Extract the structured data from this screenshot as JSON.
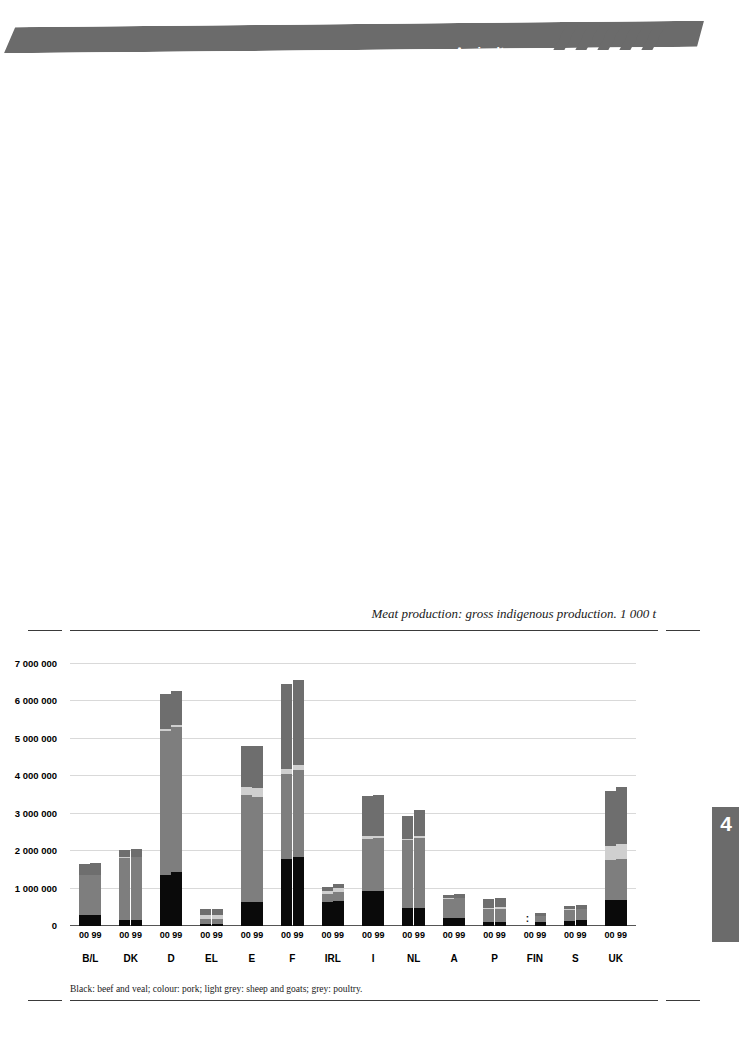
{
  "header": {
    "section_title": "Agriculture",
    "banner_color": "#6b6b6b",
    "stripe_count": 5
  },
  "page_tab": {
    "number": "4",
    "color": "#6b6b6b"
  },
  "footnote": "Black: beef and veal; colour: pork; light grey: sheep and goats; grey: poultry.",
  "chart_data": {
    "type": "bar",
    "subtype": "stacked-grouped",
    "title": "Meat production: gross indigenous production. 1 000 t",
    "xlabel": "",
    "ylabel": "",
    "ylim": [
      0,
      7000000
    ],
    "grid": true,
    "legend_position": "footnote",
    "yticks": [
      0,
      1000000,
      2000000,
      3000000,
      4000000,
      5000000,
      6000000,
      7000000
    ],
    "ytick_labels": [
      "0",
      "1 000 000",
      "2 000 000",
      "3 000 000",
      "4 000 000",
      "5 000 000",
      "6 000 000",
      "7 000 000"
    ],
    "categories": [
      "B/L",
      "DK",
      "D",
      "EL",
      "E",
      "F",
      "IRL",
      "I",
      "NL",
      "A",
      "P",
      "FIN",
      "S",
      "UK"
    ],
    "year_labels": [
      "00",
      "99"
    ],
    "series": [
      {
        "name": "beef and veal",
        "color": "#0a0a0a",
        "key": "beef"
      },
      {
        "name": "pork",
        "color": "#7e7e7e",
        "key": "pork"
      },
      {
        "name": "sheep and goats",
        "color": "#cfcfcf",
        "key": "sheep"
      },
      {
        "name": "poultry",
        "color": "#6e6e6e",
        "key": "poultry"
      }
    ],
    "groups": [
      {
        "category": "B/L",
        "bars": [
          {
            "year": "00",
            "beef": 295000,
            "pork": 1060000,
            "sheep": 20000,
            "poultry": 290000,
            "total": 1665000
          },
          {
            "year": "99",
            "beef": 290000,
            "pork": 1065000,
            "sheep": 20000,
            "poultry": 300000,
            "total": 1675000
          }
        ]
      },
      {
        "category": "DK",
        "bars": [
          {
            "year": "00",
            "beef": 150000,
            "pork": 1680000,
            "sheep": 2000,
            "poultry": 203000,
            "total": 2035000
          },
          {
            "year": "99",
            "beef": 155000,
            "pork": 1690000,
            "sheep": 2000,
            "poultry": 205000,
            "total": 2052000
          }
        ]
      },
      {
        "category": "D",
        "bars": [
          {
            "year": "00",
            "beef": 1350000,
            "pork": 3870000,
            "sheep": 50000,
            "poultry": 940000,
            "total": 6210000
          },
          {
            "year": "99",
            "beef": 1440000,
            "pork": 3890000,
            "sheep": 50000,
            "poultry": 910000,
            "total": 6290000
          }
        ]
      },
      {
        "category": "EL",
        "bars": [
          {
            "year": "00",
            "beef": 60000,
            "pork": 130000,
            "sheep": 110000,
            "poultry": 150000,
            "total": 450000
          },
          {
            "year": "99",
            "beef": 60000,
            "pork": 130000,
            "sheep": 115000,
            "poultry": 150000,
            "total": 455000
          }
        ]
      },
      {
        "category": "E",
        "bars": [
          {
            "year": "00",
            "beef": 635000,
            "pork": 2855000,
            "sheep": 235000,
            "poultry": 1095000,
            "total": 4820000
          },
          {
            "year": "99",
            "beef": 630000,
            "pork": 2820000,
            "sheep": 240000,
            "poultry": 1130000,
            "total": 4820000
          }
        ]
      },
      {
        "category": "F",
        "bars": [
          {
            "year": "00",
            "beef": 1780000,
            "pork": 2280000,
            "sheep": 140000,
            "poultry": 2260000,
            "total": 6460000
          },
          {
            "year": "99",
            "beef": 1840000,
            "pork": 2320000,
            "sheep": 145000,
            "poultry": 2265000,
            "total": 6570000
          }
        ]
      },
      {
        "category": "IRL",
        "bars": [
          {
            "year": "00",
            "beef": 630000,
            "pork": 230000,
            "sheep": 85000,
            "poultry": 105000,
            "total": 1050000
          },
          {
            "year": "99",
            "beef": 680000,
            "pork": 240000,
            "sheep": 85000,
            "poultry": 110000,
            "total": 1115000
          }
        ]
      },
      {
        "category": "I",
        "bars": [
          {
            "year": "00",
            "beef": 935000,
            "pork": 1390000,
            "sheep": 70000,
            "poultry": 1080000,
            "total": 3475000
          },
          {
            "year": "99",
            "beef": 945000,
            "pork": 1400000,
            "sheep": 70000,
            "poultry": 1090000,
            "total": 3505000
          }
        ]
      },
      {
        "category": "NL",
        "bars": [
          {
            "year": "00",
            "beef": 480000,
            "pork": 1810000,
            "sheep": 40000,
            "poultry": 620000,
            "total": 2950000
          },
          {
            "year": "99",
            "beef": 490000,
            "pork": 1870000,
            "sheep": 40000,
            "poultry": 700000,
            "total": 3100000
          }
        ]
      },
      {
        "category": "A",
        "bars": [
          {
            "year": "00",
            "beef": 210000,
            "pork": 520000,
            "sheep": 8000,
            "poultry": 95000,
            "total": 833000
          },
          {
            "year": "99",
            "beef": 215000,
            "pork": 525000,
            "sheep": 8000,
            "poultry": 95000,
            "total": 843000
          }
        ]
      },
      {
        "category": "P",
        "bars": [
          {
            "year": "00",
            "beef": 110000,
            "pork": 340000,
            "sheep": 30000,
            "poultry": 245000,
            "total": 725000
          },
          {
            "year": "99",
            "beef": 110000,
            "pork": 355000,
            "sheep": 32000,
            "poultry": 253000,
            "total": 750000
          }
        ]
      },
      {
        "category": "FIN",
        "bars": [
          {
            "year": "00",
            "beef": null,
            "pork": null,
            "sheep": null,
            "poultry": null,
            "total": null,
            "not_available": true
          },
          {
            "year": "99",
            "beef": 95000,
            "pork": 180000,
            "sheep": 2000,
            "poultry": 68000,
            "total": 345000
          }
        ]
      },
      {
        "category": "S",
        "bars": [
          {
            "year": "00",
            "beef": 145000,
            "pork": 295000,
            "sheep": 5000,
            "poultry": 95000,
            "total": 540000
          },
          {
            "year": "99",
            "beef": 150000,
            "pork": 310000,
            "sheep": 5000,
            "poultry": 100000,
            "total": 565000
          }
        ]
      },
      {
        "category": "UK",
        "bars": [
          {
            "year": "00",
            "beef": 700000,
            "pork": 1065000,
            "sheep": 380000,
            "poultry": 1465000,
            "total": 3610000
          },
          {
            "year": "99",
            "beef": 700000,
            "pork": 1090000,
            "sheep": 400000,
            "poultry": 1520000,
            "total": 3710000
          }
        ]
      }
    ],
    "not_available_marker": ":"
  }
}
